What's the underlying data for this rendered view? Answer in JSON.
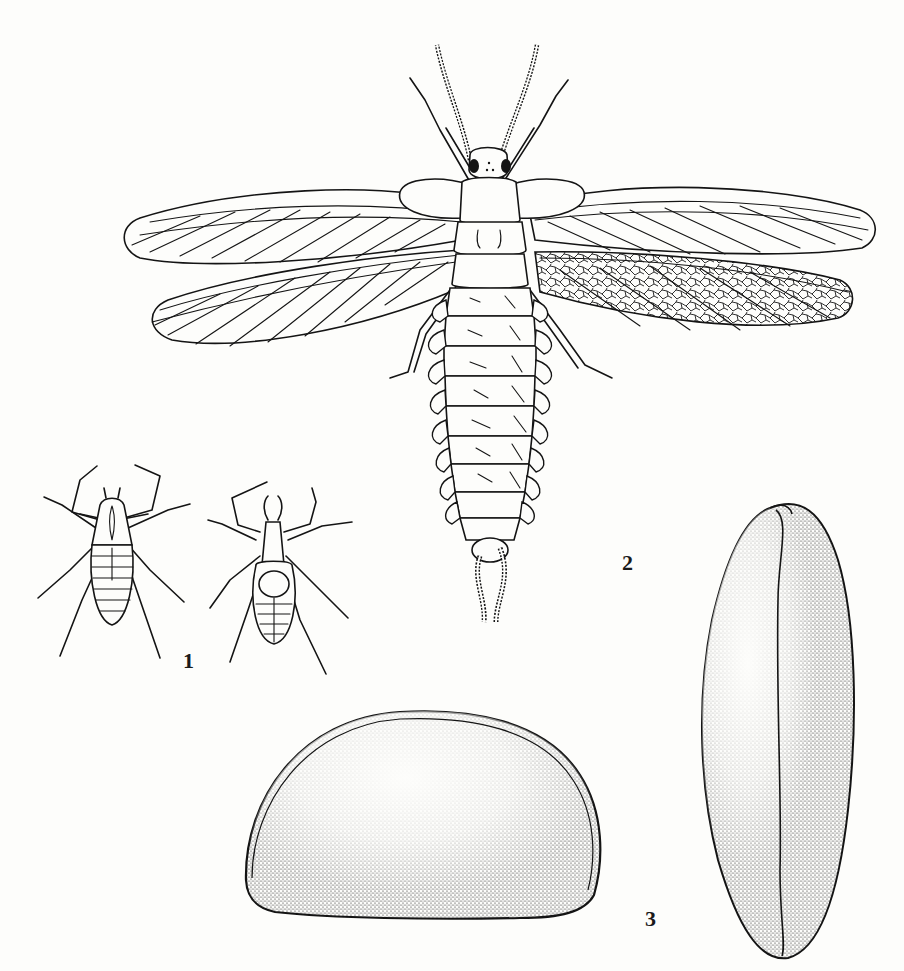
{
  "plate": {
    "background": "#fdfdfb",
    "ink": "#141414",
    "figures": [
      {
        "id": "1",
        "label": "1",
        "subject": "two arachnids (dorsal and ventral view)",
        "label_pos": [
          183,
          650
        ]
      },
      {
        "id": "2",
        "label": "2",
        "subject": "winged insect, dorsal view, wings spread",
        "label_pos": [
          622,
          552
        ]
      },
      {
        "id": "3",
        "label": "3",
        "subject": "seed/egg, lateral and end views, stippled",
        "label_pos": [
          645,
          908
        ]
      }
    ]
  }
}
